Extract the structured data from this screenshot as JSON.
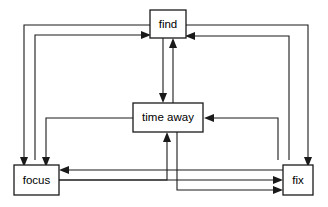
{
  "diagram": {
    "type": "flow-diagram",
    "width": 328,
    "height": 207,
    "background_color": "#ffffff",
    "line_color": "#1a1a1a",
    "text_color": "#000000",
    "nodes": [
      {
        "id": "find",
        "label": "find",
        "x": 150,
        "y": 10,
        "width": 36,
        "height": 28,
        "center_x": 168,
        "center_y": 24
      },
      {
        "id": "time_away",
        "label": "time away",
        "x": 133,
        "y": 103,
        "width": 70,
        "height": 29,
        "center_x": 168,
        "center_y": 117.5
      },
      {
        "id": "focus",
        "label": "focus",
        "x": 14,
        "y": 165,
        "width": 45,
        "height": 30,
        "center_x": 36.5,
        "center_y": 180
      },
      {
        "id": "fix",
        "label": "fix",
        "x": 283,
        "y": 165,
        "width": 30,
        "height": 30,
        "center_x": 298,
        "center_y": 180
      }
    ],
    "edges": [
      {
        "id": "find-to-time-away",
        "from": "find",
        "to": "time_away",
        "direction": "down"
      },
      {
        "id": "time-away-to-find",
        "from": "time_away",
        "to": "find",
        "direction": "up"
      },
      {
        "id": "find-to-focus",
        "from": "find",
        "to": "focus",
        "direction": "left-down"
      },
      {
        "id": "focus-to-find",
        "from": "focus",
        "to": "find",
        "direction": "up-right"
      },
      {
        "id": "find-to-fix",
        "from": "find",
        "to": "fix",
        "direction": "right-down"
      },
      {
        "id": "fix-to-find",
        "from": "fix",
        "to": "find",
        "direction": "up-left"
      },
      {
        "id": "time-away-to-focus",
        "from": "time_away",
        "to": "focus",
        "direction": "left-down"
      },
      {
        "id": "fix-to-time-away",
        "from": "fix",
        "to": "time_away",
        "direction": "up-left"
      },
      {
        "id": "time-away-to-fix",
        "from": "time_away",
        "to": "fix",
        "direction": "down-right"
      },
      {
        "id": "focus-to-time-away",
        "from": "focus",
        "to": "time_away",
        "direction": "right-up"
      },
      {
        "id": "focus-to-fix",
        "from": "focus",
        "to": "fix",
        "direction": "right"
      },
      {
        "id": "fix-to-focus",
        "from": "fix",
        "to": "focus",
        "direction": "left"
      }
    ]
  }
}
